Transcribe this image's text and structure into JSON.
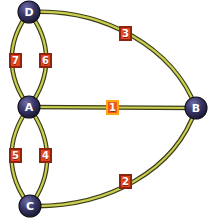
{
  "diagram": {
    "width": 215,
    "height": 224,
    "background_color": "#ffffff",
    "node_fill_color": "#2b2a52",
    "node_highlight_color": "#5b5a90",
    "node_text_color": "#ffffff",
    "edge_color": "#c9cf4e",
    "edge_outline_color": "#3d3b1a",
    "label_fill_color": "#e8441c",
    "label_border_color": "#8e2410",
    "label_selected_border_color": "#ffa416",
    "label_text_color": "#ffffff"
  },
  "nodes": [
    {
      "id": "D",
      "label": "D",
      "x": 29,
      "y": 12,
      "r": 11
    },
    {
      "id": "A",
      "label": "A",
      "x": 29,
      "y": 107,
      "r": 11
    },
    {
      "id": "B",
      "label": "B",
      "x": 196,
      "y": 108,
      "r": 11
    },
    {
      "id": "C",
      "label": "C",
      "x": 30,
      "y": 206,
      "r": 11
    }
  ],
  "edges": [
    {
      "id": "e1",
      "label": "1",
      "from": "A",
      "to": "B",
      "shape": "straight",
      "selected": true,
      "label_x": 106,
      "label_y": 100
    },
    {
      "id": "e2",
      "label": "2",
      "from": "C",
      "to": "B",
      "shape": "curve",
      "selected": false,
      "label_x": 119,
      "label_y": 174
    },
    {
      "id": "e3",
      "label": "3",
      "from": "D",
      "to": "B",
      "shape": "curve",
      "selected": false,
      "label_x": 119,
      "label_y": 26
    },
    {
      "id": "e4",
      "label": "4",
      "from": "A",
      "to": "C",
      "shape": "curve-right",
      "selected": false,
      "label_x": 39,
      "label_y": 148
    },
    {
      "id": "e5",
      "label": "5",
      "from": "A",
      "to": "C",
      "shape": "curve-left",
      "selected": false,
      "label_x": 9,
      "label_y": 148
    },
    {
      "id": "e6",
      "label": "6",
      "from": "A",
      "to": "D",
      "shape": "curve-right",
      "selected": false,
      "label_x": 39,
      "label_y": 53
    },
    {
      "id": "e7",
      "label": "7",
      "from": "A",
      "to": "D",
      "shape": "curve-left",
      "selected": false,
      "label_x": 9,
      "label_y": 53
    }
  ],
  "graph_data": {
    "type": "graph",
    "directed": false,
    "node_count": 4,
    "edge_count": 7,
    "node_ids": [
      "D",
      "A",
      "B",
      "C"
    ],
    "adjacency": [
      {
        "edge": "1",
        "endpoints": [
          "A",
          "B"
        ]
      },
      {
        "edge": "2",
        "endpoints": [
          "C",
          "B"
        ]
      },
      {
        "edge": "3",
        "endpoints": [
          "D",
          "B"
        ]
      },
      {
        "edge": "4",
        "endpoints": [
          "A",
          "C"
        ]
      },
      {
        "edge": "5",
        "endpoints": [
          "A",
          "C"
        ]
      },
      {
        "edge": "6",
        "endpoints": [
          "A",
          "D"
        ]
      },
      {
        "edge": "7",
        "endpoints": [
          "A",
          "D"
        ]
      }
    ],
    "selected_edge": "1"
  }
}
